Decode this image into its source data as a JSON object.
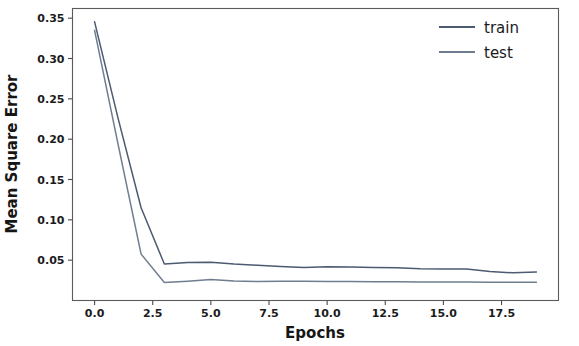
{
  "chart_data": {
    "type": "line",
    "title": "",
    "xlabel": "Epochs",
    "ylabel": "Mean Square Error",
    "xlim": [
      -0.95,
      19.95
    ],
    "ylim": [
      0.0,
      0.362
    ],
    "grid": false,
    "legend_position": "upper right",
    "xticks": [
      "0.0",
      "2.5",
      "5.0",
      "7.5",
      "10.0",
      "12.5",
      "15.0",
      "17.5"
    ],
    "xtick_values": [
      0.0,
      2.5,
      5.0,
      7.5,
      10.0,
      12.5,
      15.0,
      17.5
    ],
    "yticks": [
      "0.05",
      "0.10",
      "0.15",
      "0.20",
      "0.25",
      "0.30",
      "0.35"
    ],
    "ytick_values": [
      0.05,
      0.1,
      0.15,
      0.2,
      0.25,
      0.3,
      0.35
    ],
    "x": [
      0,
      1,
      2,
      3,
      4,
      5,
      6,
      7,
      8,
      9,
      10,
      11,
      12,
      13,
      14,
      15,
      16,
      17,
      18,
      19
    ],
    "series": [
      {
        "name": "train",
        "color": "#4c5a72",
        "values": [
          0.3455,
          0.227,
          0.115,
          0.0452,
          0.047,
          0.0474,
          0.0452,
          0.0437,
          0.0423,
          0.041,
          0.0417,
          0.0414,
          0.0408,
          0.0405,
          0.0394,
          0.039,
          0.0392,
          0.036,
          0.0343,
          0.0353
        ]
      },
      {
        "name": "test",
        "color": "#6f7d90",
        "values": [
          0.335,
          0.195,
          0.0575,
          0.0222,
          0.0238,
          0.026,
          0.0243,
          0.0234,
          0.024,
          0.0238,
          0.0236,
          0.0234,
          0.0232,
          0.0231,
          0.023,
          0.0229,
          0.0228,
          0.0226,
          0.0225,
          0.0225
        ]
      }
    ]
  },
  "legend": {
    "entries": [
      {
        "label": "train",
        "color": "#4c5a72"
      },
      {
        "label": "test",
        "color": "#6f7d90"
      }
    ]
  },
  "axes": {
    "x_axis_label": "Epochs",
    "y_axis_label": "Mean Square Error"
  }
}
